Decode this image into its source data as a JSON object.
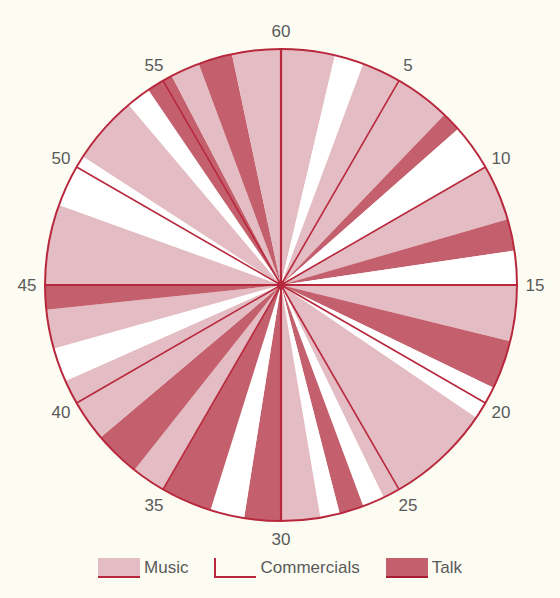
{
  "chart_data": {
    "type": "pie",
    "title": "",
    "subtitle": "One hour of radio programming (minutes 0–60, clockwise)",
    "center": [
      281,
      285
    ],
    "radius": 236,
    "minutes_per_revolution": 60,
    "tick_labels": [
      "60",
      "5",
      "10",
      "15",
      "20",
      "25",
      "30",
      "35",
      "40",
      "45",
      "50",
      "55"
    ],
    "tick_minutes": [
      0,
      5,
      10,
      15,
      20,
      25,
      30,
      35,
      40,
      45,
      50,
      55
    ],
    "categories": [
      "Music",
      "Commercials",
      "Talk"
    ],
    "colors": {
      "Music": "#e4bcc3",
      "Commercials": "#ffffff",
      "Talk": "#c4606e",
      "line": "#b8283c",
      "background": "#fdfcf3",
      "label": "#5a5a5a"
    },
    "segments": [
      {
        "start": 0.0,
        "end": 2.2,
        "type": "Music"
      },
      {
        "start": 2.2,
        "end": 3.4,
        "type": "Commercials"
      },
      {
        "start": 3.4,
        "end": 7.3,
        "type": "Music"
      },
      {
        "start": 7.3,
        "end": 8.1,
        "type": "Talk"
      },
      {
        "start": 8.1,
        "end": 10.0,
        "type": "Commercials"
      },
      {
        "start": 10.0,
        "end": 12.3,
        "type": "Music"
      },
      {
        "start": 12.3,
        "end": 13.6,
        "type": "Talk"
      },
      {
        "start": 13.6,
        "end": 15.0,
        "type": "Commercials"
      },
      {
        "start": 15.0,
        "end": 17.3,
        "type": "Music"
      },
      {
        "start": 17.3,
        "end": 19.3,
        "type": "Talk"
      },
      {
        "start": 19.3,
        "end": 20.7,
        "type": "Commercials"
      },
      {
        "start": 20.7,
        "end": 25.7,
        "type": "Music"
      },
      {
        "start": 25.7,
        "end": 26.6,
        "type": "Commercials"
      },
      {
        "start": 26.6,
        "end": 27.6,
        "type": "Talk"
      },
      {
        "start": 27.6,
        "end": 28.4,
        "type": "Commercials"
      },
      {
        "start": 28.4,
        "end": 30.0,
        "type": "Music"
      },
      {
        "start": 30.0,
        "end": 31.5,
        "type": "Talk"
      },
      {
        "start": 31.5,
        "end": 32.9,
        "type": "Commercials"
      },
      {
        "start": 32.9,
        "end": 35.0,
        "type": "Talk"
      },
      {
        "start": 35.0,
        "end": 36.4,
        "type": "Music"
      },
      {
        "start": 36.4,
        "end": 38.3,
        "type": "Talk"
      },
      {
        "start": 38.3,
        "end": 41.0,
        "type": "Music"
      },
      {
        "start": 41.0,
        "end": 42.4,
        "type": "Commercials"
      },
      {
        "start": 42.4,
        "end": 44.0,
        "type": "Music"
      },
      {
        "start": 44.0,
        "end": 45.0,
        "type": "Talk"
      },
      {
        "start": 45.0,
        "end": 48.3,
        "type": "Music"
      },
      {
        "start": 48.3,
        "end": 50.5,
        "type": "Commercials"
      },
      {
        "start": 50.5,
        "end": 53.3,
        "type": "Music"
      },
      {
        "start": 53.3,
        "end": 54.3,
        "type": "Commercials"
      },
      {
        "start": 54.3,
        "end": 55.4,
        "type": "Talk"
      },
      {
        "start": 55.4,
        "end": 56.6,
        "type": "Music"
      },
      {
        "start": 56.6,
        "end": 58.0,
        "type": "Talk"
      },
      {
        "start": 58.0,
        "end": 60.0,
        "type": "Music"
      }
    ],
    "totals_minutes": {
      "Music": 33.6,
      "Commercials": 13.6,
      "Talk": 12.8
    },
    "legend_position": "bottom"
  },
  "legend": {
    "items": [
      {
        "key": "music",
        "label": "Music"
      },
      {
        "key": "commercials",
        "label": "Commercials"
      },
      {
        "key": "talk",
        "label": "Talk"
      }
    ]
  }
}
